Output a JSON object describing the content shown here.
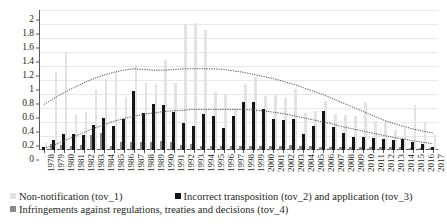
{
  "chart_data": {
    "type": "bar",
    "title": "",
    "subtitle": "",
    "xlabel": "",
    "ylabel": "",
    "ylim": [
      0,
      2
    ],
    "ytick_step": 0.2,
    "yticks": [
      "2",
      "1.8",
      "1.6",
      "1.4",
      "1.2",
      "1",
      "0.8",
      "0.6",
      "0.4",
      "0.2",
      "0"
    ],
    "ytick_values": [
      2,
      1.8,
      1.6,
      1.4,
      1.2,
      1,
      0.8,
      0.6,
      0.4,
      0.2,
      0
    ],
    "grid": true,
    "legend_position": "bottom-left",
    "categories": [
      "1978",
      "1979",
      "1980",
      "1981",
      "1982",
      "1983",
      "1984",
      "1985",
      "1986",
      "1987",
      "1988",
      "1989",
      "1990",
      "1991",
      "1992",
      "1993",
      "1994",
      "1995",
      "1996",
      "1997",
      "1998",
      "1999",
      "2000",
      "2001",
      "2002",
      "2003",
      "2004",
      "2005",
      "2006",
      "2007",
      "2008",
      "2009",
      "2010",
      "2011",
      "2012",
      "2013",
      "2014",
      "2015",
      "2016",
      "2017"
    ],
    "series": [
      {
        "name": "Non-notification (tov_1)",
        "key": "tov1",
        "color": "#e3e3e3",
        "values": [
          0.1,
          1.12,
          1.4,
          0.52,
          0.55,
          0.86,
          1.02,
          1.12,
          0.76,
          1.22,
          0.96,
          0.95,
          1.28,
          0.96,
          1.8,
          1.82,
          1.72,
          0.83,
          0.8,
          0.58,
          0.95,
          1.05,
          0.77,
          0.79,
          0.74,
          0.87,
          0.53,
          0.56,
          0.7,
          0.52,
          0.5,
          0.48,
          0.69,
          0.42,
          0.41,
          0.29,
          0.31,
          0.65,
          0.4,
          0.22
        ]
      },
      {
        "name": "Incorrect transposition (tov_2) and application (tov_3)",
        "key": "tov23",
        "color": "#151515",
        "values": [
          0.04,
          0.14,
          0.23,
          0.23,
          0.21,
          0.36,
          0.46,
          0.35,
          0.44,
          0.84,
          0.53,
          0.66,
          0.64,
          0.54,
          0.39,
          0.35,
          0.51,
          0.48,
          0.31,
          0.49,
          0.69,
          0.69,
          0.59,
          0.45,
          0.43,
          0.44,
          0.23,
          0.35,
          0.56,
          0.33,
          0.25,
          0.19,
          0.19,
          0.17,
          0.16,
          0.15,
          0.16,
          0.11,
          0.09,
          0.05
        ]
      },
      {
        "name": "Infringements against regulations, treaties and decisions (tov_4)",
        "key": "tov4",
        "color": "#8a8a8a",
        "values": [
          0.02,
          0.08,
          0.07,
          0.06,
          0.07,
          0.21,
          0.25,
          0.06,
          0.11,
          0.11,
          0.11,
          0.12,
          0.13,
          0.12,
          0.07,
          0.08,
          0.06,
          0.06,
          0.06,
          0.06,
          0.06,
          0.06,
          0.06,
          0.06,
          0.06,
          0.07,
          0.06,
          0.06,
          0.05,
          0.05,
          0.04,
          0.04,
          0.04,
          0.04,
          0.04,
          0.04,
          0.04,
          0.03,
          0.03,
          0.03
        ]
      }
    ],
    "trendlines": [
      {
        "name": "trend-upper",
        "for_series": "Non-notification (tov_1)",
        "style": "dotted",
        "color": "#4a4a4a",
        "values": [
          0.65,
          0.74,
          0.82,
          0.89,
          0.96,
          1.02,
          1.07,
          1.11,
          1.14,
          1.16,
          1.15,
          1.14,
          1.14,
          1.15,
          1.16,
          1.16,
          1.16,
          1.16,
          1.15,
          1.13,
          1.11,
          1.08,
          1.05,
          1.02,
          0.98,
          0.94,
          0.89,
          0.84,
          0.79,
          0.73,
          0.67,
          0.61,
          0.55,
          0.49,
          0.43,
          0.38,
          0.34,
          0.3,
          0.27,
          0.24
        ]
      },
      {
        "name": "trend-lower",
        "for_series": "Incorrect transposition (tov_2) and application (tov_3)",
        "style": "dotted",
        "color": "#4a4a4a",
        "values": [
          0.02,
          0.07,
          0.13,
          0.19,
          0.25,
          0.31,
          0.36,
          0.41,
          0.45,
          0.48,
          0.51,
          0.53,
          0.55,
          0.56,
          0.57,
          0.58,
          0.58,
          0.58,
          0.58,
          0.58,
          0.58,
          0.57,
          0.56,
          0.54,
          0.52,
          0.49,
          0.46,
          0.43,
          0.4,
          0.37,
          0.33,
          0.3,
          0.27,
          0.24,
          0.21,
          0.18,
          0.16,
          0.13,
          0.11,
          0.09
        ]
      }
    ]
  },
  "legend": {
    "rows": [
      {
        "entries": [
          {
            "swatch": "tov1",
            "label": "Non-notification (tov_1)"
          },
          {
            "swatch": "tov23",
            "label": "Incorrect transposition (tov_2) and application (tov_3)"
          }
        ]
      },
      {
        "entries": [
          {
            "swatch": "tov4",
            "label": "Infringements against regulations, treaties and decisions (tov_4)"
          }
        ]
      }
    ]
  }
}
